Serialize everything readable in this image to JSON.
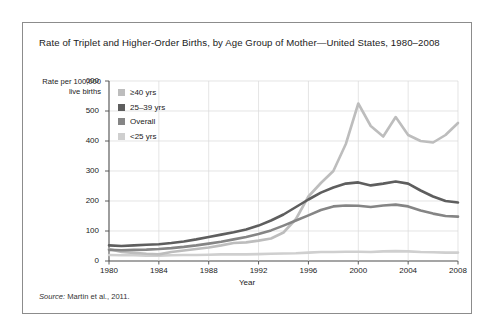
{
  "figure": {
    "title": "Rate of  Triplet and Higher-Order Births, by Age Group of Mother—United States, 1980–2008",
    "source_label": "Source:",
    "source_text": " Martin et al., 2011."
  },
  "chart_data": {
    "type": "line",
    "title": "Rate of  Triplet and Higher-Order Births, by Age Group of Mother—United States, 1980–2008",
    "xlabel": "Year",
    "ylabel": "Rate per 100,000 live births",
    "xlim": [
      1980,
      2008
    ],
    "ylim": [
      0,
      600
    ],
    "yticks": [
      0,
      100,
      200,
      300,
      400,
      500,
      600
    ],
    "xticks": [
      1980,
      1984,
      1988,
      1992,
      1996,
      2000,
      2004,
      2008
    ],
    "grid": true,
    "legend_position": "upper-left-inside",
    "x": [
      1980,
      1981,
      1982,
      1983,
      1984,
      1985,
      1986,
      1987,
      1988,
      1989,
      1990,
      1991,
      1992,
      1993,
      1994,
      1995,
      1996,
      1997,
      1998,
      1999,
      2000,
      2001,
      2002,
      2003,
      2004,
      2005,
      2006,
      2007,
      2008
    ],
    "series": [
      {
        "name": "≥40 yrs",
        "color": "#bdbdbd",
        "values": [
          40,
          30,
          27,
          24,
          22,
          30,
          35,
          40,
          45,
          52,
          60,
          62,
          68,
          75,
          95,
          140,
          215,
          260,
          300,
          390,
          525,
          450,
          415,
          480,
          420,
          400,
          395,
          420,
          460
        ]
      },
      {
        "name": "25–39 yrs",
        "color": "#5e5e5e",
        "values": [
          52,
          50,
          52,
          54,
          56,
          60,
          65,
          72,
          80,
          88,
          96,
          105,
          118,
          135,
          155,
          180,
          205,
          228,
          245,
          258,
          262,
          252,
          258,
          265,
          258,
          235,
          215,
          200,
          195
        ]
      },
      {
        "name": "Overall",
        "color": "#858585",
        "values": [
          37,
          36,
          37,
          38,
          40,
          43,
          47,
          52,
          58,
          64,
          72,
          80,
          90,
          102,
          118,
          135,
          152,
          170,
          182,
          185,
          184,
          180,
          185,
          188,
          182,
          168,
          158,
          150,
          148
        ]
      },
      {
        "name": "<25 yrs",
        "color": "#cfcfcf",
        "values": [
          20,
          19,
          19,
          18,
          18,
          19,
          20,
          20,
          21,
          22,
          22,
          22,
          23,
          24,
          25,
          26,
          28,
          30,
          30,
          31,
          31,
          30,
          32,
          33,
          32,
          30,
          29,
          28,
          28
        ]
      }
    ],
    "legend": [
      "≥40 yrs",
      "25–39 yrs",
      "Overall",
      "<25 yrs"
    ]
  },
  "colors": {
    "panel_border": "#8c8c8c",
    "grid": "#d8d8d8",
    "axis": "#4d4d4d",
    "text": "#1a1a1a"
  }
}
